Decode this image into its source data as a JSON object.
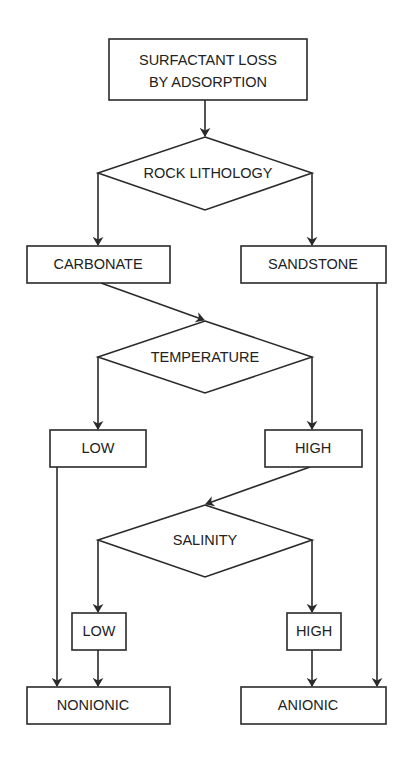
{
  "diagram": {
    "type": "flowchart",
    "nodes": {
      "start": "SURFACTANT LOSS",
      "start_line2": "BY ADSORPTION",
      "decision_lithology": "ROCK LITHOLOGY",
      "carbonate": "CARBONATE",
      "sandstone": "SANDSTONE",
      "decision_temperature": "TEMPERATURE",
      "temp_low": "LOW",
      "temp_high": "HIGH",
      "decision_salinity": "SALINITY",
      "sal_low": "LOW",
      "sal_high": "HIGH",
      "nonionic": "NONIONIC",
      "anionic": "ANIONIC"
    },
    "edges": [
      [
        "start",
        "decision_lithology"
      ],
      [
        "decision_lithology",
        "carbonate"
      ],
      [
        "decision_lithology",
        "sandstone"
      ],
      [
        "carbonate",
        "decision_temperature"
      ],
      [
        "sandstone",
        "anionic"
      ],
      [
        "decision_temperature",
        "temp_low"
      ],
      [
        "decision_temperature",
        "temp_high"
      ],
      [
        "temp_low",
        "nonionic"
      ],
      [
        "temp_high",
        "decision_salinity"
      ],
      [
        "decision_salinity",
        "sal_low"
      ],
      [
        "decision_salinity",
        "sal_high"
      ],
      [
        "sal_low",
        "nonionic"
      ],
      [
        "sal_high",
        "anionic"
      ]
    ],
    "colors": {
      "stroke": "#2a2a2a",
      "text": "#222222",
      "background": "#ffffff"
    }
  }
}
